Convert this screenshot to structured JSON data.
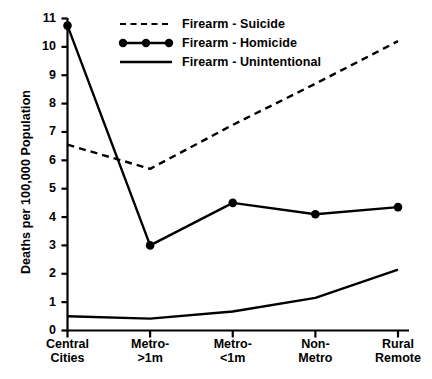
{
  "chart_data": {
    "type": "line",
    "title": "",
    "xlabel": "",
    "ylabel": "Deaths per 100,000 Population",
    "categories": [
      "Central Cities",
      "Metro- >1m",
      "Metro- <1m",
      "Non- Metro",
      "Rural Remote"
    ],
    "category_lines": [
      [
        "Central",
        "Cities"
      ],
      [
        "Metro-",
        ">1m"
      ],
      [
        "Metro-",
        "<1m"
      ],
      [
        "Non-",
        "Metro"
      ],
      [
        "Rural",
        "Remote"
      ]
    ],
    "ylim": [
      0,
      11
    ],
    "yticks": [
      "0",
      "1",
      "2",
      "3",
      "4",
      "5",
      "6",
      "7",
      "8",
      "9",
      "10",
      "11"
    ],
    "grid": false,
    "legend_position": "top-left inside plot",
    "series": [
      {
        "name": "Firearm - Suicide",
        "style": "dashed",
        "marker": "none",
        "color": "#000000",
        "values": [
          6.55,
          5.7,
          7.25,
          8.7,
          10.2
        ]
      },
      {
        "name": "Firearm - Homicide",
        "style": "solid",
        "marker": "filled-circle",
        "color": "#000000",
        "values": [
          10.75,
          3.0,
          4.5,
          4.1,
          4.35
        ]
      },
      {
        "name": "Firearm - Unintentional",
        "style": "solid",
        "marker": "none",
        "color": "#000000",
        "values": [
          0.5,
          0.42,
          0.67,
          1.15,
          2.15
        ]
      }
    ]
  },
  "axes": {
    "y_title": "Deaths per 100,000 Population"
  },
  "legend": {
    "items": [
      {
        "label": "Firearm - Suicide",
        "key": "dashed-line-key"
      },
      {
        "label": "Firearm - Homicide",
        "key": "dotted-marker-line-key"
      },
      {
        "label": "Firearm - Unintentional",
        "key": "solid-line-key"
      }
    ]
  }
}
